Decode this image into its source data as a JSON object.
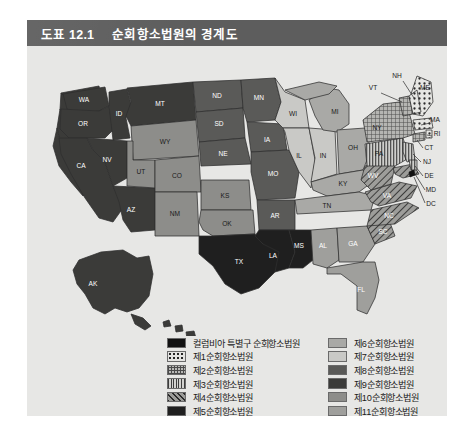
{
  "figure": {
    "number": "도표 12.1",
    "title": "순회항소법원의 경계도"
  },
  "legend": {
    "left_items": [
      {
        "label": "컬럼비아 특별구 순회항소법원",
        "swatch": "solid-black",
        "color": "#111111"
      },
      {
        "label": "제1순회항소법원",
        "swatch": "dotted",
        "color": "#242424"
      },
      {
        "label": "제2순회항소법원",
        "swatch": "crosshatch",
        "color": "#4a4a4a"
      },
      {
        "label": "제3순회항소법원",
        "swatch": "vertical-lines",
        "color": "#3c3c3c"
      },
      {
        "label": "제4순회항소법원",
        "swatch": "diagonal-hatch",
        "color": "#2a2a2a"
      },
      {
        "label": "제5순회항소법원",
        "swatch": "solid-dark",
        "color": "#1f1f1f"
      }
    ],
    "right_items": [
      {
        "label": "제6순회항소법원",
        "swatch": "solid-gray",
        "color": "#a9a9a6"
      },
      {
        "label": "제7순회항소법원",
        "swatch": "solid-gray",
        "color": "#c9c9c6"
      },
      {
        "label": "제8순회항소법원",
        "swatch": "solid-gray",
        "color": "#5a5a58"
      },
      {
        "label": "제9순회항소법원",
        "swatch": "solid-gray",
        "color": "#3b3b39"
      },
      {
        "label": "제10순회항소법원",
        "swatch": "solid-gray",
        "color": "#8d8d8a"
      },
      {
        "label": "제11순회항소법원",
        "swatch": "solid-gray",
        "color": "#9f9f9c"
      }
    ]
  },
  "map": {
    "states": [
      {
        "code": "WA",
        "circuit": 9
      },
      {
        "code": "OR",
        "circuit": 9
      },
      {
        "code": "CA",
        "circuit": 9
      },
      {
        "code": "NV",
        "circuit": 9
      },
      {
        "code": "ID",
        "circuit": 9
      },
      {
        "code": "MT",
        "circuit": 9
      },
      {
        "code": "AZ",
        "circuit": 9
      },
      {
        "code": "AK",
        "circuit": 9
      },
      {
        "code": "HI",
        "circuit": 9
      },
      {
        "code": "WY",
        "circuit": 10
      },
      {
        "code": "UT",
        "circuit": 10
      },
      {
        "code": "CO",
        "circuit": 10
      },
      {
        "code": "NM",
        "circuit": 10
      },
      {
        "code": "KS",
        "circuit": 10
      },
      {
        "code": "OK",
        "circuit": 10
      },
      {
        "code": "ND",
        "circuit": 8
      },
      {
        "code": "SD",
        "circuit": 8
      },
      {
        "code": "NE",
        "circuit": 8
      },
      {
        "code": "MN",
        "circuit": 8
      },
      {
        "code": "IA",
        "circuit": 8
      },
      {
        "code": "MO",
        "circuit": 8
      },
      {
        "code": "AR",
        "circuit": 8
      },
      {
        "code": "TX",
        "circuit": 5
      },
      {
        "code": "LA",
        "circuit": 5
      },
      {
        "code": "MS",
        "circuit": 5
      },
      {
        "code": "WI",
        "circuit": 7
      },
      {
        "code": "IL",
        "circuit": 7
      },
      {
        "code": "IN",
        "circuit": 7
      },
      {
        "code": "MI",
        "circuit": 6
      },
      {
        "code": "OH",
        "circuit": 6
      },
      {
        "code": "KY",
        "circuit": 6
      },
      {
        "code": "TN",
        "circuit": 6
      },
      {
        "code": "AL",
        "circuit": 11
      },
      {
        "code": "GA",
        "circuit": 11
      },
      {
        "code": "FL",
        "circuit": 11
      },
      {
        "code": "SC",
        "circuit": 4
      },
      {
        "code": "NC",
        "circuit": 4
      },
      {
        "code": "VA",
        "circuit": 4
      },
      {
        "code": "WV",
        "circuit": 4
      },
      {
        "code": "MD",
        "circuit": 4
      },
      {
        "code": "PA",
        "circuit": 3
      },
      {
        "code": "NJ",
        "circuit": 3
      },
      {
        "code": "DE",
        "circuit": 3
      },
      {
        "code": "NY",
        "circuit": 2
      },
      {
        "code": "VT",
        "circuit": 2
      },
      {
        "code": "CT",
        "circuit": 2
      },
      {
        "code": "ME",
        "circuit": 1
      },
      {
        "code": "NH",
        "circuit": 1
      },
      {
        "code": "MA",
        "circuit": 1
      },
      {
        "code": "RI",
        "circuit": 1
      },
      {
        "code": "DC",
        "circuit": 0
      }
    ]
  }
}
